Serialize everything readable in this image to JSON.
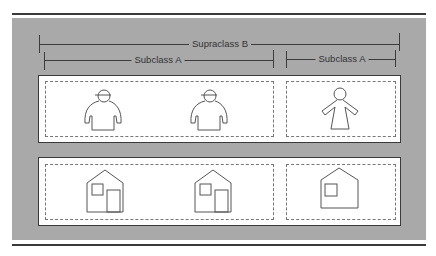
{
  "diagram": {
    "supraclass": {
      "label": "Supraclass B"
    },
    "subclasses": [
      {
        "label": "Subclass A",
        "span": "left"
      },
      {
        "label": "Subclass A",
        "span": "right"
      }
    ],
    "rows": [
      {
        "name": "people",
        "groups": [
          {
            "subclass": 0,
            "items": [
              "male-person-icon",
              "male-person-icon"
            ]
          },
          {
            "subclass": 1,
            "items": [
              "female-person-icon"
            ]
          }
        ]
      },
      {
        "name": "houses",
        "groups": [
          {
            "subclass": 0,
            "items": [
              "house-with-door-icon",
              "house-with-door-icon"
            ]
          },
          {
            "subclass": 1,
            "items": [
              "house-without-door-icon"
            ]
          }
        ]
      }
    ],
    "colors": {
      "panel": "#a9a9a9",
      "box": "#ffffff",
      "line": "#3a3a3a",
      "dash": "#777777"
    }
  }
}
